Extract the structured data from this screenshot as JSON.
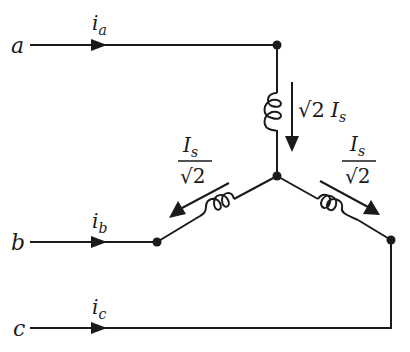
{
  "diagram": {
    "type": "circuit-schematic",
    "terminals": [
      {
        "id": "a",
        "label": "a",
        "current_label": "i",
        "current_sub": "a"
      },
      {
        "id": "b",
        "label": "b",
        "current_label": "i",
        "current_sub": "b"
      },
      {
        "id": "c",
        "label": "c",
        "current_label": "i",
        "current_sub": "c"
      }
    ],
    "windings": {
      "vertical": {
        "current_coef": "√2",
        "current_symbol": "I",
        "current_sub": "s"
      },
      "left": {
        "numerator": "I",
        "numerator_sub": "s",
        "denominator": "√2"
      },
      "right": {
        "numerator": "I",
        "numerator_sub": "s",
        "denominator": "√2"
      }
    },
    "colors": {
      "ink": "#1a1a1a",
      "background": "#ffffff"
    }
  }
}
